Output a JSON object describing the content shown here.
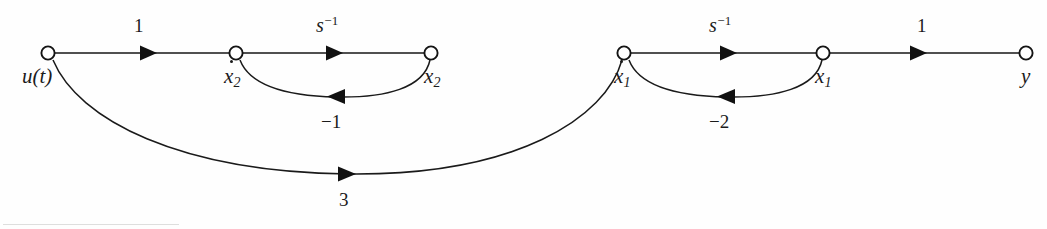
{
  "figure": {
    "kind": "signal-flow-graph",
    "background_color": "#fefefe",
    "stroke_color": "#161616",
    "width": 1047,
    "height": 229
  },
  "nodes": [
    {
      "id": "u",
      "label": "u(t)",
      "base": "u(t)",
      "sub": "",
      "dot": false,
      "x": 48,
      "y": 53,
      "label_x": 22,
      "label_y": 66
    },
    {
      "id": "x2d",
      "label": "ẋ₂",
      "base": "x",
      "sub": "2",
      "dot": true,
      "x": 236,
      "y": 53,
      "label_x": 224,
      "label_y": 66
    },
    {
      "id": "x2",
      "label": "x₂",
      "base": "x",
      "sub": "2",
      "dot": false,
      "x": 431,
      "y": 53,
      "label_x": 424,
      "label_y": 66
    },
    {
      "id": "x1d",
      "label": "ẋ₁",
      "base": "x",
      "sub": "1",
      "dot": true,
      "x": 624,
      "y": 53,
      "label_x": 614,
      "label_y": 66
    },
    {
      "id": "x1",
      "label": "x₁",
      "base": "x",
      "sub": "1",
      "dot": false,
      "x": 823,
      "y": 53,
      "label_x": 815,
      "label_y": 66
    },
    {
      "id": "y",
      "label": "y",
      "base": "y",
      "sub": "",
      "dot": false,
      "x": 1026,
      "y": 53,
      "label_x": 1021,
      "label_y": 66
    }
  ],
  "edges": [
    {
      "id": "e-u-x2d",
      "from": "u",
      "to": "x2d",
      "gain": "1",
      "gain_sup": "",
      "style": "straight",
      "direction": "forward",
      "label_x": 134,
      "label_y": 16,
      "arrow_x": 148,
      "arrow_y": 53
    },
    {
      "id": "e-x2d-x2",
      "from": "x2d",
      "to": "x2",
      "gain": "s",
      "gain_sup": "−1",
      "style": "straight",
      "direction": "forward",
      "label_x": 316,
      "label_y": 14,
      "arrow_x": 334,
      "arrow_y": 53
    },
    {
      "id": "e-x2-x2d",
      "from": "x2",
      "to": "x2d",
      "gain": "−1",
      "gain_sup": "",
      "style": "arc-below",
      "direction": "backward",
      "label_x": 321,
      "label_y": 112,
      "arrow_x": 336,
      "arrow_y": 96
    },
    {
      "id": "e-x1d-x1",
      "from": "x1d",
      "to": "x1",
      "gain": "s",
      "gain_sup": "−1",
      "style": "straight",
      "direction": "forward",
      "label_x": 709,
      "label_y": 14,
      "arrow_x": 728,
      "arrow_y": 53
    },
    {
      "id": "e-x1-x1d",
      "from": "x1",
      "to": "x1d",
      "gain": "−2",
      "gain_sup": "",
      "style": "arc-below",
      "direction": "backward",
      "label_x": 709,
      "label_y": 112,
      "arrow_x": 726,
      "arrow_y": 96
    },
    {
      "id": "e-x1-y",
      "from": "x1",
      "to": "y",
      "gain": "1",
      "gain_sup": "",
      "style": "straight",
      "direction": "forward",
      "label_x": 917,
      "label_y": 16,
      "arrow_x": 928,
      "arrow_y": 53
    },
    {
      "id": "e-u-x1d",
      "from": "u",
      "to": "x1d",
      "gain": "3",
      "gain_sup": "",
      "style": "arc-deep",
      "direction": "forward",
      "label_x": 339,
      "label_y": 190,
      "arrow_x": 348,
      "arrow_y": 173
    }
  ]
}
